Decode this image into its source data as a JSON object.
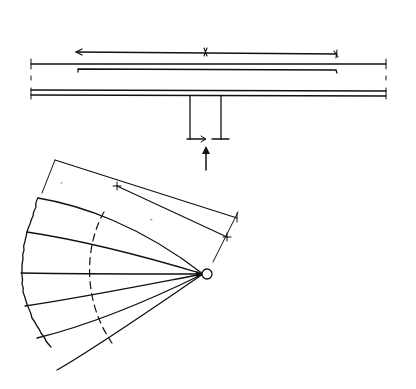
{
  "figure": {
    "type": "structural-engineering-diagram"
  },
  "beam": {
    "load_label": "p",
    "load_arrow_count": 12,
    "dimensions": [
      {
        "label": "c"
      },
      {
        "label": "c"
      }
    ],
    "reaction_label": "S"
  },
  "fan_mechanism": {
    "radius_label": "r",
    "inner_dim_label": "c",
    "zero_moment_label": "m'p = 0",
    "zero_moment_main": "m",
    "zero_moment_sub": "p",
    "zero_moment_tail": "=0",
    "negative_moment_label": "-m'p",
    "negative_moment_main": "-m",
    "negative_moment_sub": "p",
    "load_label": "p",
    "positive_moment_label": "mp",
    "positive_moment_main": "m",
    "positive_moment_sub": "p"
  },
  "colors": {
    "ink": "#111111",
    "background": "#ffffff"
  }
}
